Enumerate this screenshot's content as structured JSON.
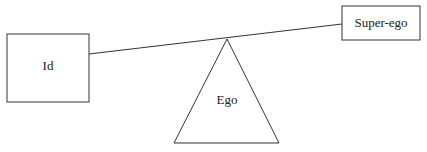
{
  "diagram": {
    "nodes": {
      "id": {
        "label": "Id"
      },
      "superego": {
        "label": "Super-ego"
      },
      "ego": {
        "label": "Ego"
      }
    },
    "colors": {
      "stroke": "#333333",
      "background": "#ffffff",
      "text": "#222222"
    }
  }
}
